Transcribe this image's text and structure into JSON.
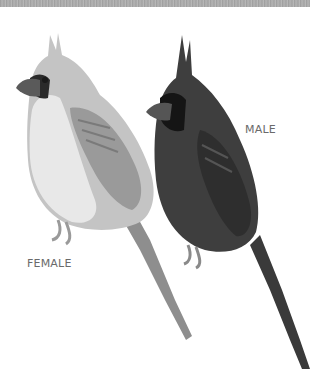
{
  "figure": {
    "labels": {
      "male": "MALE",
      "female": "FEMALE"
    },
    "colors": {
      "background": "#ffffff",
      "top_band": "#a8a8a8",
      "female_body": "#bdbdbd",
      "female_breast": "#e6e6e6",
      "male_body": "#3c3c3c",
      "mask": "#1a1a1a",
      "label_text": "#6a6a6a"
    }
  }
}
